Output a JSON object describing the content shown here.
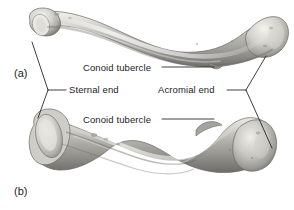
{
  "figure": {
    "background_color": "#ffffff",
    "line_color": "#1d1d1d",
    "text_color": "#1d1d1d",
    "bone_light": "#e8e6e0",
    "bone_mid": "#b9b7b1",
    "bone_dark": "#7e7c78"
  },
  "panels": [
    {
      "tag": "(a)",
      "view": "superior"
    },
    {
      "tag": "(b)",
      "view": "inferior"
    }
  ],
  "labels": {
    "conoid_tubercle_a": "Conoid tubercle",
    "sternal_end": "Sternal end",
    "acromial_end": "Acromial end",
    "conoid_tubercle_b": "Conoid tubercle"
  }
}
